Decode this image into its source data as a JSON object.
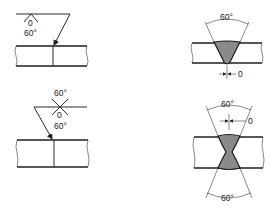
{
  "figure": {
    "top_left": {
      "symbol": "single-V butt weld symbol (arrow side)",
      "root_gap_label": "0",
      "angle_label": "60°"
    },
    "top_right": {
      "description": "single-V butt weld cross-section",
      "angle_label": "60°",
      "root_gap_label": "0"
    },
    "bottom_left": {
      "symbol": "double-V (X) butt weld symbol",
      "angle_top_label": "60°",
      "root_gap_label": "0",
      "angle_bottom_label": "60°"
    },
    "bottom_right": {
      "description": "double-V (X) butt weld cross-section",
      "angle_top_label": "60°",
      "root_gap_label": "0",
      "angle_bottom_label": "60°"
    }
  },
  "colors": {
    "line": "#2a2a2a",
    "weld_fill": "#8a8a8a",
    "background": "#ffffff"
  }
}
